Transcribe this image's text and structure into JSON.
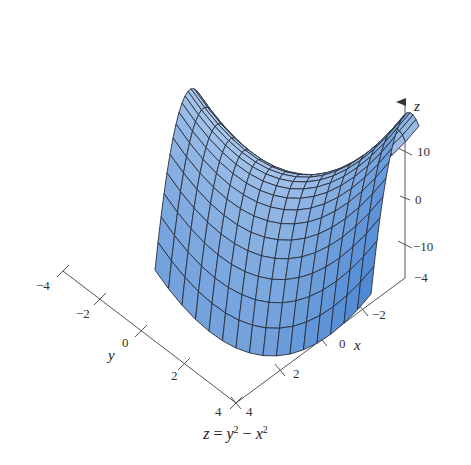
{
  "chart_data": {
    "type": "surface3d",
    "title": "",
    "caption": {
      "lhs": "z",
      "eq": " = ",
      "term1_base": "y",
      "term1_exp": "2",
      "op": " − ",
      "term2_base": "x",
      "term2_exp": "2"
    },
    "equation": "z = y^2 - x^2",
    "surface": "hyperbolic paraboloid (saddle)",
    "domain": {
      "x": [
        -4,
        4
      ],
      "y": [
        -4,
        4
      ]
    },
    "grid_divisions": 16,
    "axes": {
      "x": {
        "label": "x",
        "ticks": [
          "4",
          "2",
          "0",
          "-2"
        ],
        "range": [
          -4,
          4
        ]
      },
      "y": {
        "label": "y",
        "ticks": [
          "-4",
          "-2",
          "0",
          "2",
          "4"
        ],
        "range": [
          -4,
          4
        ]
      },
      "z": {
        "label": "z",
        "ticks": [
          "10",
          "0",
          "-10"
        ],
        "range": [
          -16,
          16
        ]
      }
    },
    "colors": {
      "surface_light": "#dbeaf8",
      "surface_mid": "#a9ccee",
      "surface_dark": "#3f7fd0",
      "mesh_line": "#2a2f3a",
      "axis_line": "#555555"
    },
    "grid": false,
    "legend": null
  },
  "labels": {
    "z_axis": "z",
    "x_axis": "x",
    "y_axis": "y",
    "z_ticks": {
      "p10": "10",
      "zero": "0",
      "m10": "−10"
    },
    "y_ticks": {
      "m4": "−4",
      "m2": "−2",
      "zero": "0",
      "p2": "2",
      "p4": "4"
    },
    "x_ticks": {
      "p4": "4",
      "p2": "2",
      "zero": "0",
      "m2": "−2",
      "m4": "−4"
    }
  }
}
